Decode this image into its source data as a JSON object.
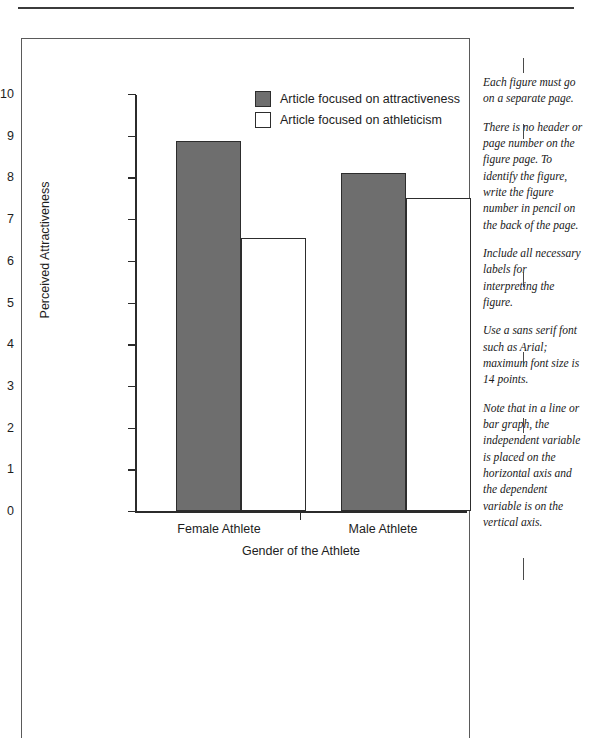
{
  "chart_data": {
    "type": "bar",
    "title": "",
    "xlabel": "Gender of the Athlete",
    "ylabel": "Perceived Attractiveness",
    "categories": [
      "Female Athlete",
      "Male Athlete"
    ],
    "series": [
      {
        "name": "Article focused on attractiveness",
        "values": [
          8.87,
          8.1
        ],
        "fill": "#6e6e6e"
      },
      {
        "name": "Article focused on athleticism",
        "values": [
          6.55,
          7.5
        ],
        "fill": "#ffffff"
      }
    ],
    "ylim": [
      0,
      10
    ],
    "yticks": [
      "0",
      "1",
      "2",
      "3",
      "4",
      "5",
      "6",
      "7",
      "8",
      "9",
      "10"
    ],
    "grid": false,
    "legend_position": "top-center"
  },
  "legend": {
    "items": [
      {
        "label": "Article focused on attractiveness",
        "swatch": "filled-gray-square"
      },
      {
        "label": "Article focused on athleticism",
        "swatch": "open-white-square"
      }
    ]
  },
  "annotations": [
    "Each figure must go on a separate page.",
    "There is no header or page number on the figure page. To identify the figure, write the figure number in pencil on the back of the page.",
    "Include all necessary labels for interpreting the figure.",
    "Use a sans serif font such as Arial; maximum font size is 14 points.",
    "Note that in a line or bar graph, the independent variable is placed on the horizontal axis and the dependent variable is on the vertical axis."
  ],
  "colors": {
    "bar_fill": "#6e6e6e",
    "bar_stroke": "#2d2d2d",
    "axis": "#2b2b2b",
    "text": "#1d1d1d",
    "border": "#5a5a5a"
  }
}
